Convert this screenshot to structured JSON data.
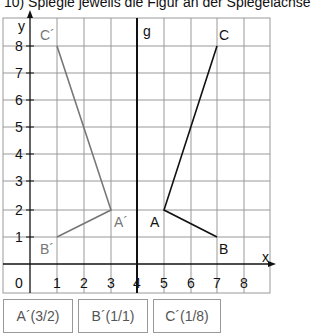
{
  "title": "10) Spiegle jeweils die Figur an der Spiegelachse",
  "axes": {
    "x_label": "x",
    "y_label": "y",
    "mirror_label": "g",
    "origin_label": "0",
    "x_ticks": [
      "1",
      "2",
      "3",
      "4",
      "5",
      "6",
      "7",
      "8"
    ],
    "y_ticks": [
      "1",
      "2",
      "3",
      "4",
      "5",
      "6",
      "7",
      "8"
    ]
  },
  "mirror_line_x": 4,
  "original": {
    "color": "#111111",
    "points": {
      "A": [
        5,
        2
      ],
      "B": [
        7,
        1
      ],
      "C": [
        7,
        8
      ]
    },
    "labels": {
      "A": "A",
      "B": "B",
      "C": "C"
    }
  },
  "image": {
    "color": "#777777",
    "points": {
      "A": [
        3,
        2
      ],
      "B": [
        1,
        1
      ],
      "C": [
        1,
        8
      ]
    },
    "labels": {
      "A": "A´",
      "B": "B´",
      "C": "C´"
    }
  },
  "answers": [
    "A´(3/2)",
    "B´(1/1)",
    "C´(1/8)"
  ]
}
